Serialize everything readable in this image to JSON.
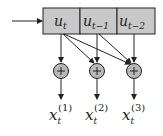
{
  "diagram": {
    "register_cells": [
      {
        "base": "u",
        "sub": "t"
      },
      {
        "base": "u",
        "sub": "t−1"
      },
      {
        "base": "u",
        "sub": "t−2"
      }
    ],
    "adders": [
      {
        "symbol": "+"
      },
      {
        "symbol": "+"
      },
      {
        "symbol": "+"
      }
    ],
    "outputs": [
      {
        "base": "x",
        "sub": "t",
        "sup": "(1)"
      },
      {
        "base": "x",
        "sub": "t",
        "sup": "(2)"
      },
      {
        "base": "x",
        "sub": "t",
        "sup": "(3)"
      }
    ],
    "colors": {
      "cell_fill": "#c8c8c8",
      "adder_fill": "#b8b8b8",
      "stroke": "#222222"
    }
  }
}
